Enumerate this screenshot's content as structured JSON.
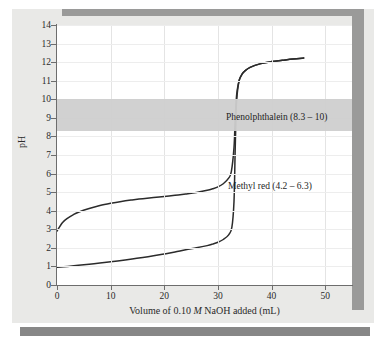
{
  "chart_data": {
    "type": "line",
    "title": "",
    "xlabel": "Volume of 0.10 M NaOH added (mL)",
    "ylabel": "pH",
    "xlim": [
      0,
      55
    ],
    "ylim": [
      0,
      14
    ],
    "xticks": [
      0,
      10,
      20,
      30,
      40,
      50
    ],
    "yticks": [
      0,
      1,
      2,
      3,
      4,
      5,
      6,
      7,
      8,
      9,
      10,
      11,
      12,
      13,
      14
    ],
    "grid": true,
    "legend_position": "none",
    "series": [
      {
        "name": "weak acid titration curve",
        "x": [
          0,
          1,
          2,
          3,
          4,
          6,
          8,
          10,
          12,
          14,
          16,
          18,
          20,
          22,
          24,
          26,
          28,
          29,
          30,
          31,
          32,
          32.5,
          33,
          33.2,
          33.4,
          33.6,
          34,
          34.5,
          35,
          36,
          38,
          40,
          42,
          44,
          46
        ],
        "y": [
          2.9,
          3.35,
          3.6,
          3.78,
          3.92,
          4.12,
          4.28,
          4.4,
          4.5,
          4.58,
          4.65,
          4.71,
          4.77,
          4.83,
          4.9,
          4.98,
          5.1,
          5.18,
          5.28,
          5.45,
          5.75,
          6.1,
          7.4,
          8.8,
          9.9,
          10.5,
          11.05,
          11.35,
          11.52,
          11.72,
          11.92,
          12.03,
          12.1,
          12.17,
          12.22
        ]
      },
      {
        "name": "strong acid titration curve",
        "x": [
          0,
          2,
          4,
          6,
          8,
          10,
          12,
          14,
          16,
          18,
          20,
          22,
          24,
          26,
          28,
          29,
          30,
          31,
          32,
          32.6,
          33,
          33.2,
          33.4,
          33.6,
          34,
          34.5,
          35,
          36,
          38,
          40,
          42,
          44,
          46
        ],
        "y": [
          0.95,
          1.0,
          1.06,
          1.12,
          1.18,
          1.25,
          1.32,
          1.4,
          1.48,
          1.57,
          1.67,
          1.78,
          1.9,
          2.0,
          2.12,
          2.2,
          2.3,
          2.45,
          2.7,
          3.1,
          4.5,
          7.0,
          9.4,
          10.3,
          11.05,
          11.35,
          11.52,
          11.72,
          11.92,
          12.03,
          12.1,
          12.17,
          12.22
        ]
      }
    ],
    "bands": [
      {
        "name": "phenolphthalein-range",
        "label": "Phenolphthalein (8.3 – 10)",
        "ymin": 8.3,
        "ymax": 10,
        "color": "#cfcfcf"
      }
    ],
    "annotations": [
      {
        "name": "phenolphthalein-label",
        "text": "Phenolphthalein (8.3 – 10)"
      },
      {
        "name": "methyl-red-label",
        "text": "Methyl red (4.2 – 6.3)"
      }
    ],
    "colors": {
      "curve": "#2b2b2b",
      "axis": "#6d6d6d",
      "grid": "#e8e8e8",
      "band": "#cfcfcf",
      "panel": "#e9e9e7",
      "shadow": "#9a9a99",
      "bottom_bar": "#878787"
    }
  },
  "axis": {
    "y_label": "pH",
    "x_label_pre": "Volume of 0.10 ",
    "x_label_italic": "M",
    "x_label_post": " NaOH added (mL)",
    "x_tick_labels": [
      "0",
      "10",
      "20",
      "30",
      "40",
      "50"
    ],
    "y_tick_labels": [
      "0",
      "1",
      "2",
      "3",
      "4",
      "5",
      "6",
      "7",
      "8",
      "9",
      "10",
      "11",
      "12",
      "13",
      "14"
    ]
  },
  "annotations": {
    "phenolphthalein": "Phenolphthalein (8.3 – 10)",
    "methyl_red": "Methyl red (4.2 – 6.3)"
  }
}
